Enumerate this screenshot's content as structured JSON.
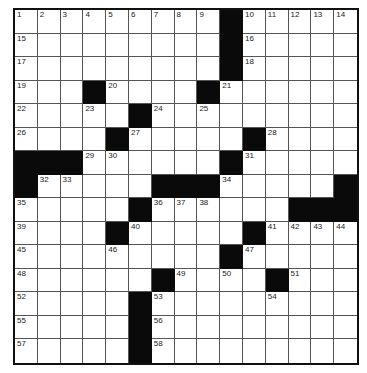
{
  "puzzle": {
    "rows": 15,
    "cols": 15,
    "colors": {
      "black": "#0a0a0a",
      "white": "#ffffff",
      "line": "#555555"
    },
    "grid": [
      "         #     ",
      "         #     ",
      "         #     ",
      "   #    #      ",
      "     #         ",
      "    #     #    ",
      "###      #     ",
      "#     ###     #",
      "     #      ###",
      "    #     #    ",
      "         #     ",
      "      #    #   ",
      "     #         ",
      "     #         ",
      "     #         "
    ],
    "numbers": [
      [
        0,
        0,
        "1"
      ],
      [
        0,
        1,
        "2"
      ],
      [
        0,
        2,
        "3"
      ],
      [
        0,
        3,
        "4"
      ],
      [
        0,
        4,
        "5"
      ],
      [
        0,
        5,
        "6"
      ],
      [
        0,
        6,
        "7"
      ],
      [
        0,
        7,
        "8"
      ],
      [
        0,
        8,
        "9"
      ],
      [
        0,
        10,
        "10"
      ],
      [
        0,
        11,
        "11"
      ],
      [
        0,
        12,
        "12"
      ],
      [
        0,
        13,
        "13"
      ],
      [
        0,
        14,
        "14"
      ],
      [
        1,
        0,
        "15"
      ],
      [
        1,
        10,
        "16"
      ],
      [
        2,
        0,
        "17"
      ],
      [
        2,
        10,
        "18"
      ],
      [
        3,
        0,
        "19"
      ],
      [
        3,
        4,
        "20"
      ],
      [
        3,
        9,
        "21"
      ],
      [
        4,
        0,
        "22"
      ],
      [
        4,
        3,
        "23"
      ],
      [
        4,
        6,
        "24"
      ],
      [
        4,
        8,
        "25"
      ],
      [
        5,
        0,
        "26"
      ],
      [
        5,
        5,
        "27"
      ],
      [
        5,
        11,
        "28"
      ],
      [
        6,
        3,
        "29"
      ],
      [
        6,
        4,
        "30"
      ],
      [
        6,
        10,
        "31"
      ],
      [
        7,
        1,
        "32"
      ],
      [
        7,
        2,
        "33"
      ],
      [
        7,
        9,
        "34"
      ],
      [
        8,
        0,
        "35"
      ],
      [
        8,
        6,
        "36"
      ],
      [
        8,
        7,
        "37"
      ],
      [
        8,
        8,
        "38"
      ],
      [
        9,
        0,
        "39"
      ],
      [
        9,
        5,
        "40"
      ],
      [
        9,
        11,
        "41"
      ],
      [
        9,
        12,
        "42"
      ],
      [
        9,
        13,
        "43"
      ],
      [
        9,
        14,
        "44"
      ],
      [
        10,
        0,
        "45"
      ],
      [
        10,
        4,
        "46"
      ],
      [
        10,
        10,
        "47"
      ],
      [
        11,
        0,
        "48"
      ],
      [
        11,
        7,
        "49"
      ],
      [
        11,
        9,
        "50"
      ],
      [
        11,
        12,
        "51"
      ],
      [
        12,
        0,
        "52"
      ],
      [
        12,
        6,
        "53"
      ],
      [
        12,
        11,
        "54"
      ],
      [
        13,
        0,
        "55"
      ],
      [
        13,
        6,
        "56"
      ],
      [
        14,
        0,
        "57"
      ],
      [
        14,
        6,
        "58"
      ]
    ]
  }
}
